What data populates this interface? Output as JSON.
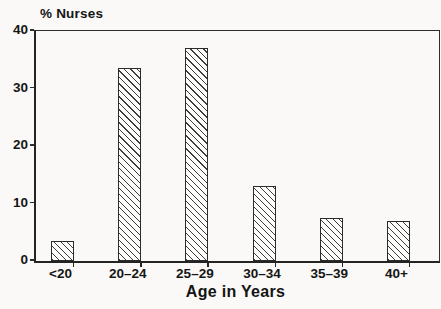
{
  "figure": {
    "y_axis_header": "% Nurses",
    "x_axis_title": "Age in Years"
  },
  "chart_data": {
    "type": "bar",
    "title": "% Nurses",
    "xlabel": "Age in Years",
    "ylabel": "% Nurses",
    "categories": [
      "<20",
      "20–24",
      "25–29",
      "30–34",
      "35–39",
      "40+"
    ],
    "values": [
      3.5,
      33.5,
      37,
      13,
      7.5,
      7
    ],
    "ylim": [
      0,
      40
    ],
    "yticks": [
      0,
      10,
      20,
      30,
      40
    ],
    "grid": false,
    "legend": "none",
    "bar_style": "white fill with black diagonal hatching (backslash direction), black outline",
    "colors": {
      "line": "#2b2b2b",
      "text": "#151515",
      "background": "#faf9f7",
      "bar_fill": "#fdfdfb",
      "hatch": "#3c3c3c"
    }
  }
}
